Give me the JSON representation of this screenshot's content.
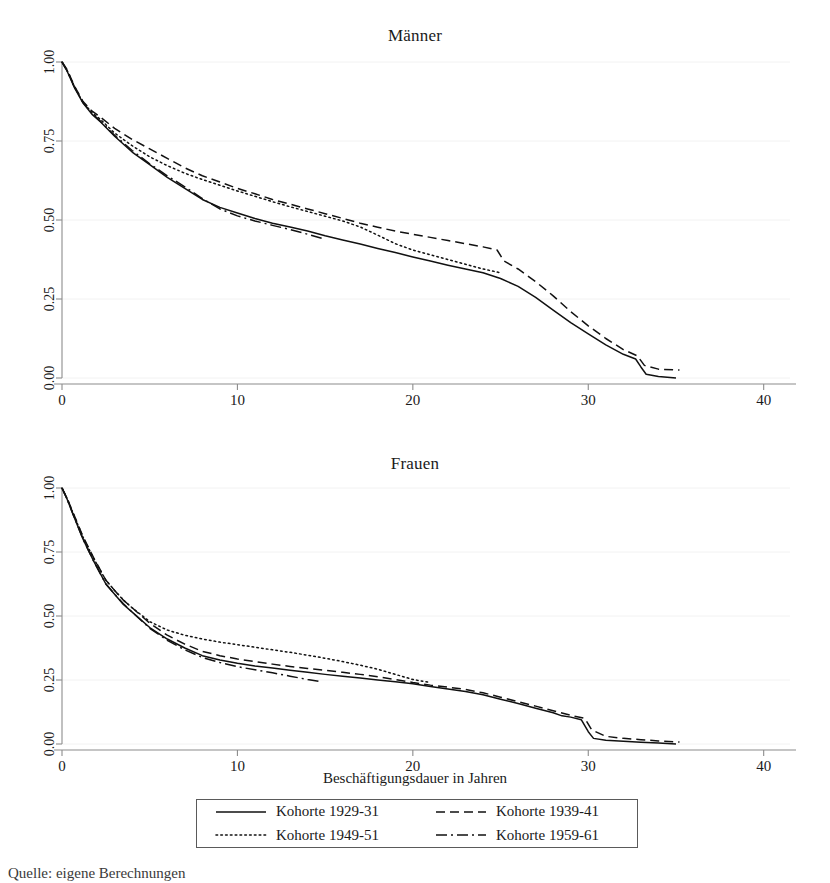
{
  "figure": {
    "xaxis_title": "Beschäftigungsdauer in Jahren",
    "caption": "Quelle: eigene Berechnungen"
  },
  "legend": {
    "items": [
      {
        "label": "Kohorte 1929-31",
        "style": "solid",
        "sample_name": "legend-sample-solid"
      },
      {
        "label": "Kohorte 1939-41",
        "style": "dashed",
        "sample_name": "legend-sample-dashed"
      },
      {
        "label": "Kohorte 1949-51",
        "style": "dotted",
        "sample_name": "legend-sample-dotted"
      },
      {
        "label": "Kohorte 1959-61",
        "style": "dashdot",
        "sample_name": "legend-sample-dashdot"
      }
    ]
  },
  "chart_data": [
    {
      "type": "line",
      "title": "Männer",
      "xlabel": "Beschäftigungsdauer in Jahren",
      "ylabel": "",
      "xlim": [
        0,
        41.5
      ],
      "ylim": [
        0,
        1.0
      ],
      "xticks": [
        0,
        10,
        20,
        30,
        40
      ],
      "xtick_labels": [
        "0",
        "10",
        "20",
        "30",
        "40"
      ],
      "yticks": [
        0.0,
        0.25,
        0.5,
        0.75,
        1.0
      ],
      "ytick_labels": [
        "0.00",
        "0.25",
        "0.50",
        "0.75",
        "1.00"
      ],
      "grid": true,
      "legend_position": "below-figure",
      "series": [
        {
          "name": "Kohorte 1929-31",
          "style": "solid",
          "x": [
            0,
            0.3,
            0.7,
            1.2,
            1.7,
            2.2,
            3.0,
            4.0,
            5.0,
            6.0,
            7.0,
            8.0,
            9.0,
            10.0,
            11.0,
            12.0,
            13.0,
            14.0,
            15.0,
            16.0,
            17.0,
            18.0,
            19.0,
            20.0,
            21.0,
            22.0,
            23.0,
            24.0,
            25.0,
            26.0,
            27.0,
            28.0,
            29.0,
            30.0,
            31.0,
            32.0,
            32.7,
            33.0,
            33.3,
            34.0,
            35.0
          ],
          "y": [
            1.0,
            0.97,
            0.92,
            0.87,
            0.835,
            0.81,
            0.765,
            0.715,
            0.675,
            0.635,
            0.6,
            0.565,
            0.54,
            0.522,
            0.505,
            0.49,
            0.478,
            0.465,
            0.45,
            0.437,
            0.424,
            0.41,
            0.397,
            0.383,
            0.37,
            0.357,
            0.345,
            0.333,
            0.315,
            0.29,
            0.255,
            0.215,
            0.175,
            0.14,
            0.105,
            0.075,
            0.06,
            0.035,
            0.012,
            0.005,
            0.0
          ]
        },
        {
          "name": "Kohorte 1939-41",
          "style": "dashed",
          "x": [
            0,
            0.3,
            0.7,
            1.2,
            1.7,
            2.2,
            3.0,
            4.0,
            5.0,
            6.0,
            7.0,
            8.0,
            9.0,
            10.0,
            11.0,
            12.0,
            13.0,
            14.0,
            15.0,
            16.0,
            17.0,
            18.0,
            19.0,
            20.0,
            21.0,
            22.0,
            23.0,
            24.0,
            24.8,
            25.2,
            26.0,
            27.0,
            28.0,
            29.0,
            30.0,
            31.0,
            32.0,
            32.8,
            33.2,
            34.0,
            35.2
          ],
          "y": [
            1.0,
            0.975,
            0.925,
            0.875,
            0.845,
            0.825,
            0.79,
            0.755,
            0.725,
            0.695,
            0.665,
            0.64,
            0.62,
            0.6,
            0.583,
            0.565,
            0.55,
            0.535,
            0.52,
            0.505,
            0.49,
            0.477,
            0.465,
            0.455,
            0.445,
            0.435,
            0.425,
            0.415,
            0.405,
            0.37,
            0.345,
            0.305,
            0.26,
            0.21,
            0.165,
            0.125,
            0.09,
            0.07,
            0.04,
            0.028,
            0.025
          ]
        },
        {
          "name": "Kohorte 1949-51",
          "style": "dotted",
          "x": [
            0,
            0.3,
            0.7,
            1.2,
            1.7,
            2.2,
            3.0,
            4.0,
            5.0,
            6.0,
            7.0,
            8.0,
            9.0,
            10.0,
            11.0,
            12.0,
            13.0,
            14.0,
            15.0,
            16.0,
            17.0,
            18.0,
            19.0,
            20.0,
            21.0,
            22.0,
            23.0,
            24.0,
            25.0
          ],
          "y": [
            1.0,
            0.972,
            0.922,
            0.872,
            0.84,
            0.818,
            0.775,
            0.735,
            0.7,
            0.672,
            0.648,
            0.628,
            0.61,
            0.592,
            0.575,
            0.558,
            0.542,
            0.527,
            0.512,
            0.497,
            0.478,
            0.452,
            0.425,
            0.405,
            0.39,
            0.375,
            0.36,
            0.345,
            0.333
          ]
        },
        {
          "name": "Kohorte 1959-61",
          "style": "dashdot",
          "x": [
            0,
            0.3,
            0.7,
            1.2,
            1.7,
            2.2,
            3.0,
            4.0,
            5.0,
            6.0,
            7.0,
            8.0,
            9.0,
            10.0,
            11.0,
            12.0,
            13.0,
            14.0,
            14.8
          ],
          "y": [
            1.0,
            0.972,
            0.922,
            0.872,
            0.838,
            0.812,
            0.768,
            0.72,
            0.678,
            0.64,
            0.605,
            0.568,
            0.535,
            0.513,
            0.497,
            0.483,
            0.47,
            0.455,
            0.442
          ]
        }
      ]
    },
    {
      "type": "line",
      "title": "Frauen",
      "xlabel": "Beschäftigungsdauer in Jahren",
      "ylabel": "",
      "xlim": [
        0,
        41.5
      ],
      "ylim": [
        0,
        1.0
      ],
      "xticks": [
        0,
        10,
        20,
        30,
        40
      ],
      "xtick_labels": [
        "0",
        "10",
        "20",
        "30",
        "40"
      ],
      "yticks": [
        0.0,
        0.25,
        0.5,
        0.75,
        1.0
      ],
      "ytick_labels": [
        "0.00",
        "0.25",
        "0.50",
        "0.75",
        "1.00"
      ],
      "grid": true,
      "legend_position": "below-figure",
      "series": [
        {
          "name": "Kohorte 1929-31",
          "style": "solid",
          "x": [
            0,
            0.3,
            0.7,
            1.2,
            1.8,
            2.5,
            3.0,
            3.5,
            4.0,
            5.0,
            6.0,
            7.0,
            8.0,
            9.0,
            10.0,
            11.0,
            12.0,
            13.0,
            14.0,
            15.0,
            16.0,
            17.0,
            18.0,
            19.0,
            20.0,
            21.0,
            22.0,
            23.0,
            24.0,
            25.0,
            26.0,
            27.0,
            28.0,
            28.5,
            29.0,
            29.6,
            30.0,
            30.3,
            31.0,
            32.0,
            33.0,
            34.0,
            35.0
          ],
          "y": [
            1.0,
            0.955,
            0.885,
            0.8,
            0.715,
            0.625,
            0.585,
            0.545,
            0.515,
            0.455,
            0.41,
            0.375,
            0.345,
            0.328,
            0.315,
            0.305,
            0.297,
            0.288,
            0.28,
            0.272,
            0.265,
            0.258,
            0.25,
            0.243,
            0.235,
            0.225,
            0.215,
            0.205,
            0.192,
            0.175,
            0.158,
            0.14,
            0.122,
            0.11,
            0.105,
            0.095,
            0.048,
            0.022,
            0.015,
            0.011,
            0.007,
            0.004,
            0.0
          ]
        },
        {
          "name": "Kohorte 1939-41",
          "style": "dashed",
          "x": [
            0,
            0.3,
            0.7,
            1.2,
            1.8,
            2.5,
            3.0,
            3.5,
            4.0,
            5.0,
            6.0,
            7.0,
            8.0,
            9.0,
            10.0,
            11.0,
            12.0,
            13.0,
            14.0,
            15.0,
            16.0,
            17.0,
            18.0,
            19.0,
            20.0,
            21.0,
            22.0,
            23.0,
            24.0,
            25.0,
            26.0,
            27.0,
            28.0,
            29.0,
            29.8,
            30.2,
            31.0,
            32.0,
            33.0,
            34.0,
            35.2
          ],
          "y": [
            1.0,
            0.958,
            0.892,
            0.81,
            0.728,
            0.64,
            0.6,
            0.562,
            0.532,
            0.472,
            0.425,
            0.39,
            0.362,
            0.345,
            0.332,
            0.322,
            0.312,
            0.303,
            0.295,
            0.288,
            0.28,
            0.272,
            0.263,
            0.252,
            0.24,
            0.23,
            0.222,
            0.213,
            0.2,
            0.183,
            0.165,
            0.148,
            0.13,
            0.112,
            0.1,
            0.055,
            0.03,
            0.022,
            0.017,
            0.012,
            0.008
          ]
        },
        {
          "name": "Kohorte 1949-51",
          "style": "dotted",
          "x": [
            0,
            0.3,
            0.7,
            1.2,
            1.8,
            2.5,
            3.0,
            3.5,
            4.0,
            5.0,
            6.0,
            7.0,
            8.0,
            9.0,
            10.0,
            11.0,
            12.0,
            13.0,
            14.0,
            15.0,
            16.0,
            17.0,
            18.0,
            19.0,
            20.0,
            21.0
          ],
          "y": [
            1.0,
            0.958,
            0.89,
            0.808,
            0.725,
            0.64,
            0.6,
            0.562,
            0.532,
            0.478,
            0.445,
            0.425,
            0.41,
            0.398,
            0.388,
            0.378,
            0.368,
            0.358,
            0.347,
            0.335,
            0.322,
            0.308,
            0.292,
            0.272,
            0.252,
            0.24
          ]
        },
        {
          "name": "Kohorte 1959-61",
          "style": "dashdot",
          "x": [
            0,
            0.3,
            0.7,
            1.2,
            1.8,
            2.5,
            3.0,
            3.5,
            4.0,
            5.0,
            6.0,
            7.0,
            8.0,
            9.0,
            10.0,
            11.0,
            12.0,
            13.0,
            14.0,
            14.8
          ],
          "y": [
            1.0,
            0.955,
            0.885,
            0.8,
            0.715,
            0.625,
            0.585,
            0.548,
            0.515,
            0.452,
            0.405,
            0.368,
            0.338,
            0.318,
            0.302,
            0.29,
            0.278,
            0.265,
            0.252,
            0.243
          ]
        }
      ]
    }
  ]
}
